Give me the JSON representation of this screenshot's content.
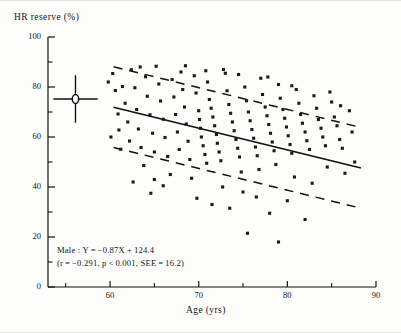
{
  "figure": {
    "y_axis_title": "HR reserve (%)",
    "x_axis_title": "Age (yrs)"
  },
  "annotation": {
    "line1": "Male : Y = −0.87X + 124.4",
    "line2": "(r = −0.291,  p < 0.001,  SEE = 16.2)"
  },
  "colors": {
    "ink": "#111111",
    "marker": "#1a1a1a",
    "background": "#fdfdfb"
  },
  "chart_data": {
    "type": "scatter",
    "title": "",
    "xlabel": "Age (yrs)",
    "ylabel": "HR reserve (%)",
    "xlim": [
      53,
      90
    ],
    "ylim": [
      0,
      100
    ],
    "grid": false,
    "legend": "none",
    "xticks": [
      60,
      70,
      80,
      90
    ],
    "xtick_labels": [
      "60",
      "70",
      "80",
      "90"
    ],
    "xminor_ticks": [
      55,
      65,
      75,
      85
    ],
    "yticks": [
      0,
      20,
      40,
      60,
      80,
      100
    ],
    "ytick_labels": [
      "0",
      "20",
      "40",
      "60",
      "80",
      "100"
    ],
    "yminor_ticks": [
      10,
      30,
      50,
      70,
      90
    ],
    "regression": {
      "equation": "Y = -0.87X + 124.4",
      "slope": -0.87,
      "intercept": 124.4,
      "r": -0.291,
      "p_text": "p<0.001",
      "see": 16.2,
      "group": "Male",
      "x_start": 60.4,
      "x_end": 88.3,
      "y_start": 71.9,
      "y_end": 47.6,
      "style": "solid"
    },
    "bands": [
      {
        "name": "upper-see-band",
        "style": "dashed",
        "x_start": 60.4,
        "y_start": 88.1,
        "x_end": 88.3,
        "y_end": 63.8
      },
      {
        "name": "lower-see-band",
        "style": "dashed",
        "x_start": 60.4,
        "y_start": 55.8,
        "x_end": 88.3,
        "y_end": 31.5
      }
    ],
    "mean_marker": {
      "name": "mean-sd-crosshair",
      "x": 56.1,
      "y": 75.2,
      "x_error": 2.5,
      "y_error": 9.5,
      "symbol": "open-circle-with-error-bars"
    },
    "series": [
      {
        "name": "Male subjects",
        "marker": "small-filled-square",
        "points": [
          [
            60.3,
            85.4
          ],
          [
            60.6,
            78.6
          ],
          [
            60.9,
            69.2
          ],
          [
            61.0,
            62.8
          ],
          [
            61.2,
            55.1
          ],
          [
            61.4,
            80.2
          ],
          [
            61.7,
            73.5
          ],
          [
            62.0,
            66.0
          ],
          [
            62.2,
            58.4
          ],
          [
            62.4,
            86.9
          ],
          [
            62.8,
            79.7
          ],
          [
            63.0,
            71.0
          ],
          [
            63.2,
            63.2
          ],
          [
            63.5,
            55.8
          ],
          [
            63.8,
            48.6
          ],
          [
            64.0,
            84.1
          ],
          [
            64.2,
            76.3
          ],
          [
            64.5,
            68.9
          ],
          [
            64.8,
            61.5
          ],
          [
            65.0,
            54.0
          ],
          [
            65.2,
            88.3
          ],
          [
            65.5,
            81.2
          ],
          [
            65.7,
            74.4
          ],
          [
            66.0,
            67.1
          ],
          [
            66.2,
            59.8
          ],
          [
            66.5,
            52.2
          ],
          [
            66.8,
            45.0
          ],
          [
            67.0,
            83.0
          ],
          [
            67.2,
            76.0
          ],
          [
            67.4,
            69.0
          ],
          [
            67.6,
            62.0
          ],
          [
            67.8,
            55.0
          ],
          [
            68.0,
            86.0
          ],
          [
            68.2,
            79.0
          ],
          [
            68.4,
            72.0
          ],
          [
            68.6,
            65.2
          ],
          [
            68.8,
            58.3
          ],
          [
            69.0,
            51.0
          ],
          [
            69.2,
            43.5
          ],
          [
            69.5,
            84.5
          ],
          [
            69.7,
            77.6
          ],
          [
            70.0,
            70.5
          ],
          [
            70.1,
            67.0
          ],
          [
            70.2,
            63.5
          ],
          [
            70.3,
            60.0
          ],
          [
            70.5,
            56.5
          ],
          [
            70.7,
            53.0
          ],
          [
            70.9,
            49.5
          ],
          [
            71.0,
            82.0
          ],
          [
            71.2,
            75.0
          ],
          [
            71.4,
            71.5
          ],
          [
            71.6,
            68.0
          ],
          [
            71.8,
            64.5
          ],
          [
            72.0,
            61.0
          ],
          [
            72.1,
            57.5
          ],
          [
            72.3,
            54.0
          ],
          [
            72.5,
            50.5
          ],
          [
            72.7,
            40.0
          ],
          [
            73.0,
            85.5
          ],
          [
            73.2,
            78.5
          ],
          [
            73.4,
            73.0
          ],
          [
            73.6,
            69.5
          ],
          [
            73.8,
            66.0
          ],
          [
            74.0,
            62.5
          ],
          [
            74.2,
            59.0
          ],
          [
            74.4,
            55.5
          ],
          [
            74.6,
            52.0
          ],
          [
            74.8,
            46.0
          ],
          [
            75.0,
            38.0
          ],
          [
            75.2,
            80.0
          ],
          [
            75.4,
            74.5
          ],
          [
            75.6,
            70.0
          ],
          [
            75.8,
            66.5
          ],
          [
            76.0,
            63.0
          ],
          [
            76.2,
            59.5
          ],
          [
            76.4,
            56.0
          ],
          [
            76.6,
            52.5
          ],
          [
            76.8,
            47.0
          ],
          [
            77.0,
            83.5
          ],
          [
            77.2,
            77.0
          ],
          [
            77.5,
            72.0
          ],
          [
            77.7,
            68.5
          ],
          [
            77.9,
            65.0
          ],
          [
            78.1,
            61.5
          ],
          [
            78.3,
            58.0
          ],
          [
            78.5,
            54.5
          ],
          [
            78.7,
            49.0
          ],
          [
            79.0,
            81.0
          ],
          [
            79.2,
            75.5
          ],
          [
            79.5,
            71.0
          ],
          [
            79.7,
            67.5
          ],
          [
            79.9,
            64.0
          ],
          [
            80.1,
            60.5
          ],
          [
            80.3,
            57.0
          ],
          [
            80.5,
            53.5
          ],
          [
            80.8,
            44.0
          ],
          [
            81.0,
            79.0
          ],
          [
            81.3,
            73.5
          ],
          [
            81.5,
            69.0
          ],
          [
            81.7,
            65.5
          ],
          [
            82.0,
            62.0
          ],
          [
            82.2,
            58.5
          ],
          [
            82.5,
            55.0
          ],
          [
            82.8,
            41.5
          ],
          [
            83.0,
            76.5
          ],
          [
            83.3,
            71.5
          ],
          [
            83.5,
            67.0
          ],
          [
            83.8,
            63.5
          ],
          [
            84.0,
            60.0
          ],
          [
            84.3,
            56.5
          ],
          [
            84.5,
            48.0
          ],
          [
            85.0,
            74.0
          ],
          [
            85.3,
            68.0
          ],
          [
            85.6,
            64.5
          ],
          [
            85.9,
            59.0
          ],
          [
            86.2,
            55.5
          ],
          [
            86.5,
            45.5
          ],
          [
            87.0,
            70.5
          ],
          [
            87.3,
            62.0
          ],
          [
            87.6,
            50.0
          ],
          [
            62.6,
            42.0
          ],
          [
            64.6,
            37.5
          ],
          [
            66.0,
            40.5
          ],
          [
            69.8,
            35.5
          ],
          [
            71.5,
            33.0
          ],
          [
            73.5,
            31.5
          ],
          [
            76.5,
            36.0
          ],
          [
            78.0,
            29.5
          ],
          [
            80.0,
            34.5
          ],
          [
            82.0,
            27.0
          ],
          [
            59.8,
            82.0
          ],
          [
            60.1,
            60.0
          ],
          [
            63.4,
            88.0
          ],
          [
            65.0,
            43.0
          ],
          [
            68.5,
            88.5
          ],
          [
            70.8,
            86.5
          ],
          [
            72.8,
            87.0
          ],
          [
            74.5,
            85.0
          ],
          [
            77.8,
            84.0
          ],
          [
            80.5,
            80.5
          ],
          [
            84.8,
            78.0
          ],
          [
            86.0,
            72.5
          ],
          [
            75.5,
            21.5
          ],
          [
            79.0,
            18.0
          ]
        ]
      }
    ]
  }
}
